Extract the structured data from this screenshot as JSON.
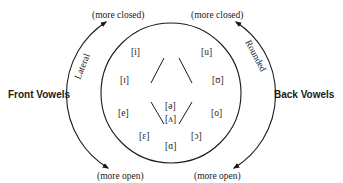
{
  "diagram": {
    "side_labels": {
      "left": "Front Vowels",
      "right": "Back Vowels"
    },
    "arc_labels": {
      "left": "Lateral",
      "right": "Rounded"
    },
    "direction_labels": {
      "top_left": "(more closed)",
      "top_right": "(more closed)",
      "bottom_left": "(more open)",
      "bottom_right": "(more open)"
    },
    "front_vowels": [
      "[i]",
      "[ɪ]",
      "[e]",
      "[ɛ]"
    ],
    "back_vowels": [
      "[u]",
      "[ʊ]",
      "[o]",
      "[ɔ]"
    ],
    "central_vowels": [
      "[ə]",
      "[ʌ]",
      "[ɑ]"
    ],
    "colors": {
      "ink": "#1a1a1a",
      "background": "#ffffff"
    }
  }
}
